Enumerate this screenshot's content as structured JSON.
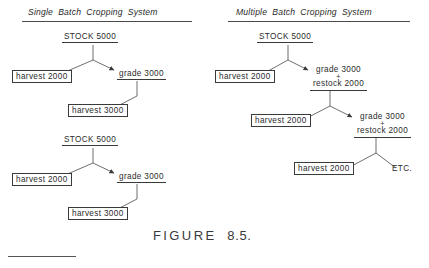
{
  "figure": {
    "caption_label": "FIGURE",
    "caption_number": "8.5."
  },
  "panels": [
    {
      "id": "single-batch",
      "title": "Single Batch Cropping System"
    },
    {
      "id": "multiple-batch",
      "title": "Multiple Batch Cropping System"
    }
  ],
  "left_panel": {
    "tree_one": {
      "root": "STOCK 5000",
      "branch_left": "harvest 2000",
      "branch_right": "grade 3000",
      "leaf": "harvest 3000"
    },
    "tree_two": {
      "root": "STOCK 5000",
      "branch_left": "harvest 2000",
      "branch_right": "grade 3000",
      "leaf": "harvest 3000"
    }
  },
  "right_panel": {
    "root": "STOCK 5000",
    "level1_left": "harvest 2000",
    "level1_right": {
      "line1": "grade 3000",
      "operator": "+",
      "line2": "restock 2000"
    },
    "level2_left": "harvest 2000",
    "level2_right": {
      "line1": "grade 3000",
      "operator": "+",
      "line2": "restock 2000"
    },
    "level3_left": "harvest 2000",
    "level3_right": "ETC."
  },
  "colors": {
    "ink": "#2b2b2b",
    "rule": "#3a3a3a",
    "background": "#ffffff"
  }
}
